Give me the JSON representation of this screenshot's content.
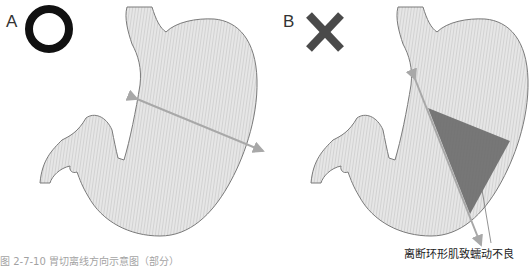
{
  "panels": [
    {
      "label": "A",
      "verdict_icon": "circle-correct-icon",
      "verdict": "correct",
      "arrow": {
        "x1": 137,
        "y1": 99,
        "x2": 263,
        "y2": 151
      }
    },
    {
      "label": "B",
      "verdict_icon": "cross-incorrect-icon",
      "verdict": "incorrect",
      "arrow": {
        "x1": 415,
        "y1": 79,
        "x2": 481,
        "y2": 245
      },
      "annotation": "离断环形肌致蠕动不良"
    }
  ],
  "figure_caption": "图 2-7-10   胃切离线方向示意图（部分）",
  "colors": {
    "stomach_fill": "#e4e4e4",
    "stomach_stroke": "#7a7a7a",
    "arrow": "#a8a8a8",
    "resected_wedge": "#6a6a6a",
    "icon_dark": "#111111",
    "cross": "#4a4a4a"
  }
}
